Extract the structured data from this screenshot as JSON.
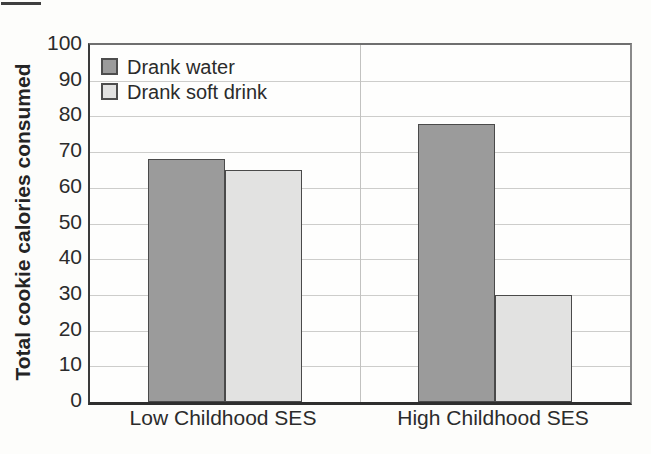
{
  "chart_data": {
    "type": "bar",
    "title": "",
    "categories": [
      "Low Childhood SES",
      "High Childhood SES"
    ],
    "series": [
      {
        "name": "Drank water",
        "values": [
          68,
          78
        ],
        "color": "#9b9b9b"
      },
      {
        "name": "Drank soft drink",
        "values": [
          65,
          30
        ],
        "color": "#e2e2e1"
      }
    ],
    "xlabel": "",
    "ylabel": "Total cookie calories consumed",
    "ylim": [
      0,
      100
    ],
    "yticks": [
      0,
      10,
      20,
      30,
      40,
      50,
      60,
      70,
      80,
      90,
      100
    ],
    "grid": true,
    "legend_position": "top-left"
  },
  "style_colors": {
    "bar_border": "#4a4a4a",
    "gridline": "#cdcdcb",
    "axis_dark": "#2e2e2e",
    "plot_border_light": "#8a8a8a",
    "category_divider": "#c2c2c0",
    "text": "#2b2b2b"
  }
}
